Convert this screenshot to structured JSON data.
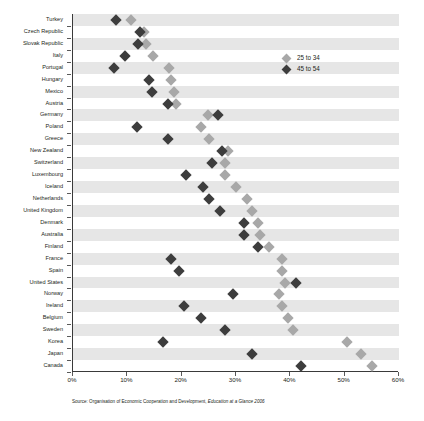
{
  "legend": {
    "position": "top-right",
    "entries": [
      {
        "label": "25 to 34",
        "color": "#a8a8a8",
        "key": "young"
      },
      {
        "label": "45 to 54",
        "color": "#3d3d3d",
        "key": "older"
      }
    ]
  },
  "source": {
    "prefix": "Source: Organisation of Economic Cooperation and Development, ",
    "italic": "Education at a Glance 2006"
  },
  "chart_data": {
    "type": "scatter",
    "title": "",
    "subtitle": "",
    "xlabel": "",
    "ylabel": "",
    "xlim": [
      0,
      60
    ],
    "xticks": [
      0,
      10,
      20,
      30,
      40,
      50,
      60
    ],
    "xticklabels": [
      "0%",
      "10%",
      "20%",
      "30%",
      "40%",
      "50%",
      "60%"
    ],
    "grid": false,
    "banded_rows": true,
    "orientation": "horizontal",
    "categories": [
      "Turkey",
      "Czech Republic",
      "Slovak Republic",
      "Italy",
      "Portugal",
      "Hungary",
      "Mexico",
      "Austria",
      "Germany",
      "Poland",
      "Greece",
      "New Zealand",
      "Switzerland",
      "Luxembourg",
      "Iceland",
      "Netherlands",
      "United Kingdom",
      "Denmark",
      "Australia",
      "Finland",
      "France",
      "Spain",
      "United States",
      "Norway",
      "Ireland",
      "Belgium",
      "Sweden",
      "Korea",
      "Japan",
      "Canada"
    ],
    "series": [
      {
        "name": "25 to 34",
        "color": "#a8a8a8",
        "marker": "diamond",
        "values": [
          10.7,
          13.0,
          13.5,
          14.8,
          17.6,
          18.0,
          18.5,
          19.0,
          24.8,
          23.6,
          25.0,
          28.6,
          28.0,
          28.0,
          30.0,
          32.0,
          33.0,
          34.0,
          34.5,
          36.0,
          38.5,
          38.5,
          39.0,
          38.0,
          38.5,
          39.5,
          40.5,
          50.5,
          53.0,
          55.0
        ]
      },
      {
        "name": "45 to 54",
        "color": "#3d3d3d",
        "marker": "diamond",
        "values": [
          7.9,
          12.3,
          12.0,
          9.6,
          7.5,
          14.0,
          14.5,
          17.5,
          26.7,
          11.8,
          17.5,
          27.5,
          25.5,
          20.8,
          24.0,
          25.0,
          27.0,
          31.5,
          31.5,
          34.0,
          18.0,
          19.5,
          41.0,
          29.5,
          20.5,
          23.5,
          28.0,
          16.5,
          33.0,
          42.0
        ]
      }
    ]
  }
}
